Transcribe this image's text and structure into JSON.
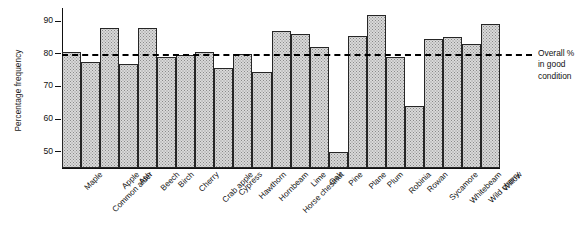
{
  "chart_data": {
    "type": "bar",
    "title": "",
    "xlabel": "",
    "ylabel": "Percentage frequency",
    "ylim": [
      45,
      94
    ],
    "yticks": [
      50,
      60,
      70,
      80,
      90
    ],
    "grid": false,
    "legend": "none",
    "categories": [
      "Maple",
      "Common alder",
      "Apple",
      "Ash",
      "Beech",
      "Birch",
      "Cherry",
      "Crab apple",
      "Cypress",
      "Hawthorn",
      "Hornbeam",
      "Horse chestnut",
      "Lime",
      "Oak",
      "Pine",
      "Plane",
      "Plum",
      "Robinia",
      "Rowan",
      "Sycamore",
      "Whitebeam",
      "Wild cherry",
      "Willow"
    ],
    "values": [
      80.5,
      77.5,
      88,
      77,
      88,
      79,
      79.5,
      80.5,
      75.5,
      80,
      74.5,
      87,
      86,
      82,
      50,
      85.5,
      92,
      79,
      64,
      84.5,
      85,
      83,
      89
    ],
    "annotations": [
      {
        "name": "overall-reference-line",
        "value": 80,
        "style": "dashed",
        "label": "Overall %\nin good\ncondition"
      }
    ]
  },
  "axis": {
    "y_label": "Percentage frequency",
    "y_tick_labels": [
      "90",
      "80",
      "70",
      "60",
      "50"
    ]
  },
  "annotation": {
    "overall_label": "Overall %\nin good\ncondition"
  },
  "caption": {
    "text": ""
  }
}
